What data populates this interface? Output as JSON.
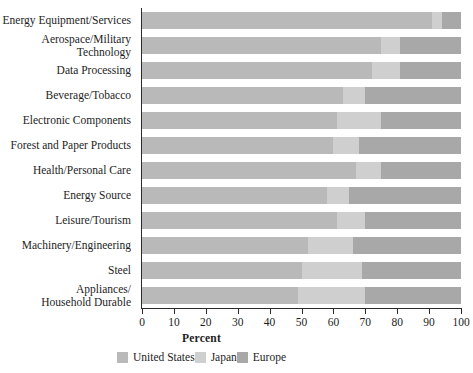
{
  "chart_data": {
    "type": "bar",
    "subtype": "horizontal-stacked-100-percent",
    "title": "",
    "xlabel": "Percent",
    "ylabel": "",
    "xlim": [
      0,
      100
    ],
    "xticks": [
      0,
      10,
      20,
      30,
      40,
      50,
      60,
      70,
      80,
      90,
      100
    ],
    "xtick_labels": [
      "0",
      "10",
      "20",
      "30",
      "40",
      "50",
      "60",
      "70",
      "80",
      "90",
      "100"
    ],
    "grid": false,
    "legend_position": "bottom",
    "orientation": "horizontal",
    "categories": [
      "Energy Equipment/Services",
      "Aerospace/Military\nTechnology",
      "Data Processing",
      "Beverage/Tobacco",
      "Electronic Components",
      "Forest and Paper Products",
      "Health/Personal Care",
      "Energy Source",
      "Leisure/Tourism",
      "Machinery/Engineering",
      "Steel",
      "Appliances/\nHousehold Durable"
    ],
    "series": [
      {
        "name": "United States",
        "color": "#b9b9b9",
        "values": [
          91,
          75,
          72,
          63,
          61,
          60,
          67,
          58,
          61,
          52,
          50,
          49
        ]
      },
      {
        "name": "Japan",
        "color": "#cfcfcf",
        "values": [
          3,
          6,
          9,
          7,
          14,
          8,
          8,
          7,
          9,
          14,
          19,
          21
        ]
      },
      {
        "name": "Europe",
        "color": "#a8a8a8",
        "values": [
          6,
          19,
          19,
          30,
          25,
          32,
          25,
          35,
          30,
          34,
          31,
          30
        ]
      }
    ]
  },
  "legend": {
    "items": [
      {
        "label": "United States",
        "color": "#b9b9b9"
      },
      {
        "label": "Japan",
        "color": "#cfcfcf"
      },
      {
        "label": "Europe",
        "color": "#a8a8a8"
      }
    ]
  },
  "axis": {
    "x_title": "Percent"
  },
  "colors": {
    "united_states": "#b9b9b9",
    "japan": "#cfcfcf",
    "europe": "#a8a8a8",
    "axis": "#2b2b2b",
    "text": "#1d1d1d",
    "background": "#ffffff"
  }
}
